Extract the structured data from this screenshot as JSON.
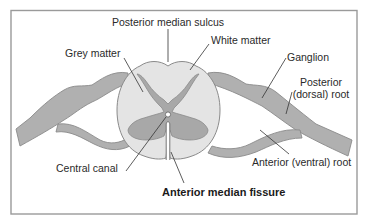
{
  "diagram": {
    "labels": {
      "posterior_median_sulcus": "Posterior median sulcus",
      "white_matter": "White matter",
      "grey_matter": "Grey matter",
      "ganglion": "Ganglion",
      "posterior_root_line1": "Posterior",
      "posterior_root_line2": "(dorsal) root",
      "central_canal": "Central canal",
      "anterior_root": "Anterior (ventral) root",
      "anterior_median_fissure": "Anterior median fissure"
    },
    "colors": {
      "frame": "#9a9a9a",
      "white_matter": "#e4e4e4",
      "grey_matter": "#a8a8a8",
      "nerve": "#b0b0b0",
      "outline": "#8a8a8a",
      "leader": "#333333"
    }
  }
}
